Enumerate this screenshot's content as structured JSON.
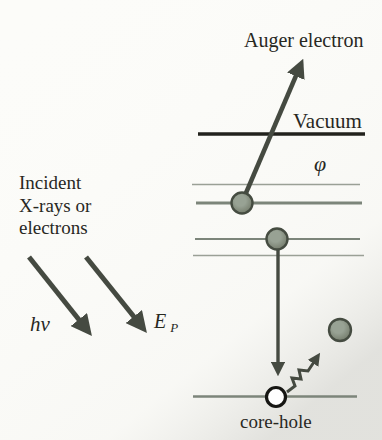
{
  "figure": {
    "labels": {
      "auger_electron": "Auger electron",
      "vacuum": "Vacuum",
      "work_function": "φ",
      "incident_line1": "Incident",
      "incident_line2": "X-rays or",
      "incident_line3": "electrons",
      "photon_energy": "hν",
      "primary_energy_symbol": "E",
      "primary_energy_subscript": "P",
      "core_hole": "core-hole"
    },
    "colors": {
      "background": "#fcfcf9",
      "text": "#28281f",
      "vacuum_level_line": "#22221d",
      "energy_level_line": "#7c857a",
      "energy_level_line_thin": "#9aa096",
      "arrow": "#454a41",
      "electron_fill": "#98a294",
      "electron_shade": "#69705f",
      "electron_outline": "#454c41",
      "core_hole_fill": "#ffffff",
      "core_hole_outline": "#161613"
    }
  }
}
